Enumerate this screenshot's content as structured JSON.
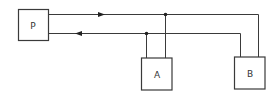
{
  "diagram": {
    "type": "block-wiring",
    "nodes": [
      {
        "id": "P",
        "label": "P"
      },
      {
        "id": "A",
        "label": "A"
      },
      {
        "id": "B",
        "label": "B"
      }
    ],
    "connections": [
      {
        "id": "outgoing-line",
        "from": "P",
        "to": [
          "A",
          "B"
        ],
        "direction": "right"
      },
      {
        "id": "return-line",
        "from": [
          "A",
          "B"
        ],
        "to": "P",
        "direction": "left"
      }
    ],
    "junctions": 2,
    "colors": {
      "line": "#3a3a3a",
      "background": "#ffffff"
    }
  }
}
